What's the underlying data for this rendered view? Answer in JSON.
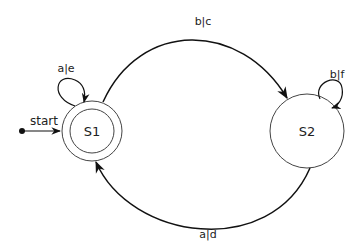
{
  "diagram": {
    "type": "finite-state-machine",
    "start_label": "start",
    "states": [
      {
        "id": "S1",
        "label": "S1",
        "accepting": true,
        "initial": true
      },
      {
        "id": "S2",
        "label": "S2",
        "accepting": false,
        "initial": false
      }
    ],
    "transitions": [
      {
        "from": "S1",
        "to": "S1",
        "label": "a|e"
      },
      {
        "from": "S1",
        "to": "S2",
        "label": "b|c"
      },
      {
        "from": "S2",
        "to": "S2",
        "label": "b|f"
      },
      {
        "from": "S2",
        "to": "S1",
        "label": "a|d"
      }
    ]
  }
}
